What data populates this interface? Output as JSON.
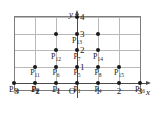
{
  "figure": {
    "type": "lattice-point-diagram",
    "axes": {
      "x_name": "x",
      "y_name": "y",
      "origin_label": "O",
      "x_ticks": [
        {
          "value": -3,
          "label": "−3"
        },
        {
          "value": -2,
          "label": "−2"
        },
        {
          "value": -1,
          "label": "−1"
        },
        {
          "value": 1,
          "label": "1"
        },
        {
          "value": 2,
          "label": "2"
        },
        {
          "value": 3,
          "label": "3"
        }
      ],
      "y_ticks": [
        {
          "value": 1,
          "label": "1"
        },
        {
          "value": 2,
          "label": "2"
        },
        {
          "value": 3,
          "label": "3"
        },
        {
          "value": 4,
          "label": "4"
        }
      ],
      "x_range": [
        -3.6,
        3.6
      ],
      "y_range": [
        -0.6,
        4.6
      ]
    },
    "grid": {
      "visible": true,
      "x_lines": [
        -3,
        -2,
        -1,
        0,
        1,
        2,
        3
      ],
      "y_lines": [
        0,
        1,
        2,
        3,
        4
      ]
    },
    "points": [
      {
        "name": "P",
        "index": "1",
        "x": 0,
        "y": 0,
        "label_dx": 0,
        "label_dy": 0.42
      },
      {
        "name": "P",
        "index": "2",
        "x": -1,
        "y": 0,
        "label_dx": 0,
        "label_dy": 0.42
      },
      {
        "name": "P",
        "index": "3",
        "x": -2,
        "y": 0,
        "label_dx": 0,
        "label_dy": 0.42
      },
      {
        "name": "P",
        "index": "4",
        "x": 1,
        "y": 0,
        "label_dx": 0,
        "label_dy": 0.42
      },
      {
        "name": "P",
        "index": "5",
        "x": 0,
        "y": 1,
        "label_dx": 0,
        "label_dy": 0.42
      },
      {
        "name": "P",
        "index": "6",
        "x": -1,
        "y": 1,
        "label_dx": 0,
        "label_dy": 0.42
      },
      {
        "name": "P",
        "index": "7",
        "x": 0,
        "y": 2,
        "label_dx": 0,
        "label_dy": 0.42
      },
      {
        "name": "P",
        "index": "8",
        "x": 1,
        "y": 1,
        "label_dx": 0,
        "label_dy": 0.42
      },
      {
        "name": "P",
        "index": "9",
        "x": -2,
        "y": 0,
        "label_dx": 0,
        "label_dy": 0.42
      },
      {
        "name": "P",
        "index": "10",
        "x": -3,
        "y": 0,
        "label_dx": 0,
        "label_dy": 0.42
      },
      {
        "name": "P",
        "index": "11",
        "x": -2,
        "y": 1,
        "label_dx": 0,
        "label_dy": 0.42
      },
      {
        "name": "P",
        "index": "12",
        "x": -1,
        "y": 2,
        "label_dx": 0,
        "label_dy": 0.42
      },
      {
        "name": "P",
        "index": "13",
        "x": 0,
        "y": 3,
        "label_dx": 0,
        "label_dy": 0.42
      },
      {
        "name": "P",
        "index": "14",
        "x": 1,
        "y": 2,
        "label_dx": 0,
        "label_dy": 0.42
      },
      {
        "name": "P",
        "index": "15",
        "x": 2,
        "y": 1,
        "label_dx": 0,
        "label_dy": 0.42
      },
      {
        "name": "P",
        "index": "16",
        "x": 3,
        "y": 0,
        "label_dx": 0,
        "label_dy": 0.42
      }
    ],
    "dots": [
      {
        "x": -3,
        "y": 0
      },
      {
        "x": -2,
        "y": 0
      },
      {
        "x": -1,
        "y": 0
      },
      {
        "x": 0,
        "y": 0
      },
      {
        "x": 1,
        "y": 0
      },
      {
        "x": 2,
        "y": 0
      },
      {
        "x": 3,
        "y": 0
      },
      {
        "x": -2,
        "y": 1
      },
      {
        "x": -1,
        "y": 1
      },
      {
        "x": 0,
        "y": 1
      },
      {
        "x": 1,
        "y": 1
      },
      {
        "x": 2,
        "y": 1
      },
      {
        "x": -1,
        "y": 2
      },
      {
        "x": 0,
        "y": 2
      },
      {
        "x": 1,
        "y": 2
      },
      {
        "x": -1,
        "y": 3
      },
      {
        "x": 0,
        "y": 3
      },
      {
        "x": 1,
        "y": 3
      },
      {
        "x": 0,
        "y": 4
      }
    ],
    "colors": {
      "dot": "#1a1a1a",
      "grid": "#b9b9b9",
      "frame": "#7d7d7d",
      "axis": "#4a4a4a",
      "text": "#1a1a1a",
      "background": "#ffffff"
    }
  }
}
